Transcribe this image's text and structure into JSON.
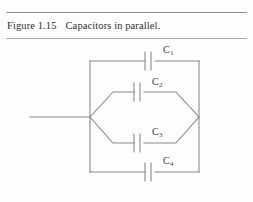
{
  "page": {
    "background_color": "#fdfdfc",
    "line_color": "#8a8a8e",
    "text_color": "#2f2f33"
  },
  "caption": {
    "figure_label": "Figure 1.15",
    "text": "Capacitors in parallel."
  },
  "rules": {
    "top_visible": true,
    "bottom_visible": true
  },
  "diagram": {
    "name": "capacitors-in-parallel-circuit",
    "components": [
      {
        "id": "C1",
        "label": "C",
        "subscript": "1",
        "branch": "top-rail"
      },
      {
        "id": "C2",
        "label": "C",
        "subscript": "2",
        "branch": "upper-middle"
      },
      {
        "id": "C3",
        "label": "C",
        "subscript": "3",
        "branch": "lower-middle"
      },
      {
        "id": "C4",
        "label": "C",
        "subscript": "4",
        "branch": "bottom-rail"
      }
    ],
    "labels": [
      {
        "id": "C1",
        "text": "C",
        "sub": "1",
        "x": 163,
        "y": 46
      },
      {
        "id": "C2",
        "text": "C",
        "sub": "2",
        "x": 152,
        "y": 78
      },
      {
        "id": "C3",
        "text": "C",
        "sub": "3",
        "x": 152,
        "y": 127
      },
      {
        "id": "C4",
        "text": "C",
        "sub": "4",
        "x": 163,
        "y": 157
      }
    ]
  }
}
